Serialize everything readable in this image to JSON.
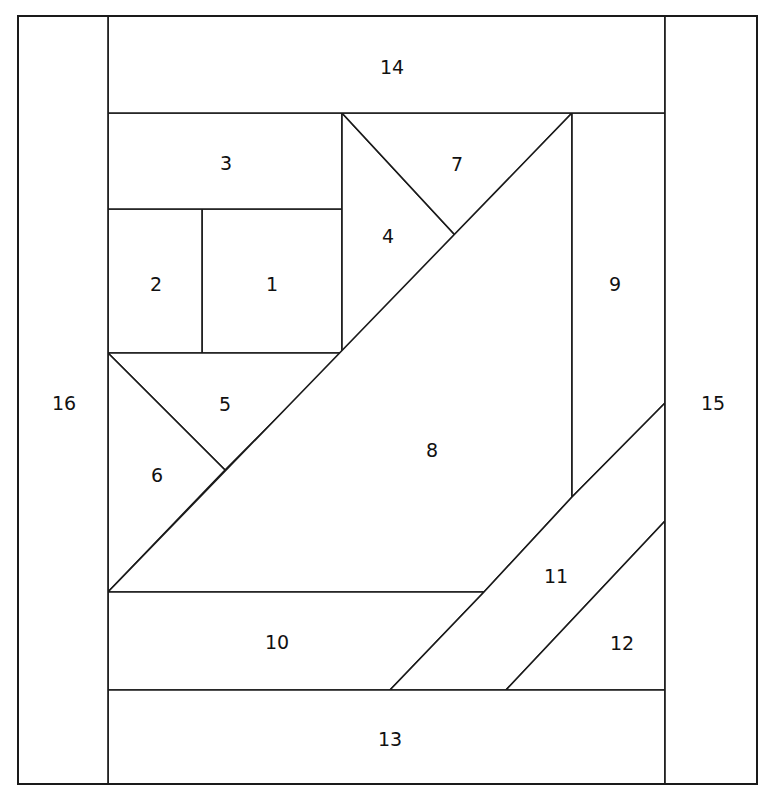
{
  "diagram": {
    "type": "quilt-block-piecing-order",
    "canvas": {
      "width": 771,
      "height": 803
    },
    "style": {
      "background_color": "#ffffff",
      "line_color": "#1a1a1a",
      "fill_color": "#ffffff",
      "label_color": "#111111"
    },
    "bounds": {
      "left": 18,
      "top": 16,
      "right": 757,
      "bottom": 784
    },
    "guide_lines": {
      "inner_left_x": 108,
      "inner_right_x": 665,
      "inner_top_y": 113,
      "inner_bottom_y": 690,
      "block_1_2_divider_x": 202,
      "block_1_2_top_y": 209,
      "block_1_2_bottom_y": 353,
      "block_4_right_x": 342,
      "piece_9_left_x": 572,
      "piece_10_top_y": 592,
      "piece_8_apex_y": 497,
      "v_apex_7": {
        "x": 455,
        "y": 235
      },
      "v_apex_5_6": {
        "x": 225,
        "y": 470
      }
    },
    "pieces": [
      {
        "number": "1",
        "label": "1",
        "label_x": 272,
        "label_y": 285,
        "points": "202,209 342,209 342,353 202,353"
      },
      {
        "number": "2",
        "label": "2",
        "label_x": 156,
        "label_y": 285,
        "points": "108,209 202,209 202,353 108,353"
      },
      {
        "number": "3",
        "label": "3",
        "label_x": 226,
        "label_y": 164,
        "points": "108,113 342,113 342,209 108,209"
      },
      {
        "number": "4",
        "label": "4",
        "label_x": 388,
        "label_y": 237,
        "points": "342,113 455,235 342,353"
      },
      {
        "number": "5",
        "label": "5",
        "label_x": 225,
        "label_y": 405,
        "points": "108,353 342,353 225,470"
      },
      {
        "number": "6",
        "label": "6",
        "label_x": 157,
        "label_y": 476,
        "points": "108,353 225,470 108,592"
      },
      {
        "number": "7",
        "label": "7",
        "label_x": 457,
        "label_y": 165,
        "points": "342,113 572,113 455,235"
      },
      {
        "number": "8",
        "label": "8",
        "label_x": 432,
        "label_y": 451,
        "points": "572,113 572,497 484,592 108,592"
      },
      {
        "number": "9",
        "label": "9",
        "label_x": 615,
        "label_y": 285,
        "points": "572,113 665,113 665,403 572,497"
      },
      {
        "number": "10",
        "label": "10",
        "label_x": 277,
        "label_y": 643,
        "points": "108,592 484,592 390,690 108,690"
      },
      {
        "number": "11",
        "label": "11",
        "label_x": 556,
        "label_y": 577,
        "points": "665,403 572,497 484,592 390,690 506,690 665,521"
      },
      {
        "number": "12",
        "label": "12",
        "label_x": 622,
        "label_y": 644,
        "points": "665,521 665,690 506,690"
      },
      {
        "number": "13",
        "label": "13",
        "label_x": 390,
        "label_y": 740,
        "points": "108,690 665,690 665,784 108,784"
      },
      {
        "number": "14",
        "label": "14",
        "label_x": 392,
        "label_y": 68,
        "points": "108,16 665,16 665,113 108,113"
      },
      {
        "number": "15",
        "label": "15",
        "label_x": 713,
        "label_y": 404,
        "points": "665,16 757,16 757,784 665,784"
      },
      {
        "number": "16",
        "label": "16",
        "label_x": 64,
        "label_y": 404,
        "points": "18,16 108,16 108,784 18,784"
      }
    ]
  }
}
